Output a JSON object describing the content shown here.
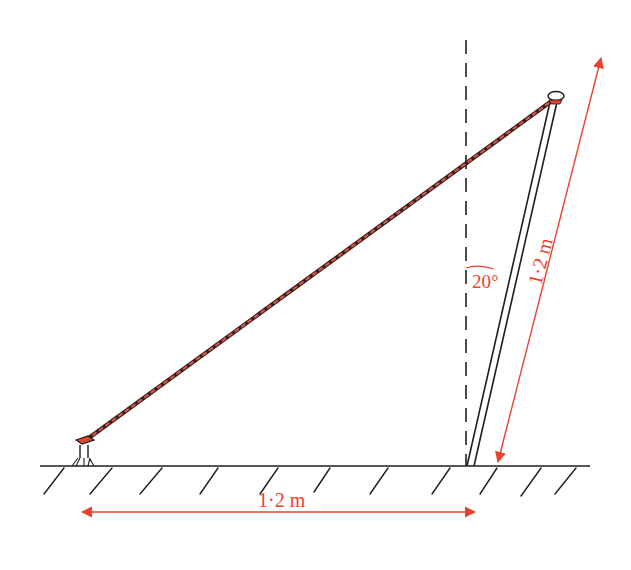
{
  "diagram": {
    "colors": {
      "annotation": "#e8432f",
      "ink": "#1e1e1e",
      "rope_stripe": "#c0392b"
    },
    "labels": {
      "ground_distance": "1·2 m",
      "pole_length": "1·2 m",
      "angle": "20°"
    },
    "elements": {
      "ground": "ground-with-hatching",
      "vertical_reference": "dashed-vertical-line",
      "pole": "pole",
      "rope": "guy-rope",
      "peg": "ground-peg",
      "pole_cap": "pole-top-cap"
    }
  }
}
